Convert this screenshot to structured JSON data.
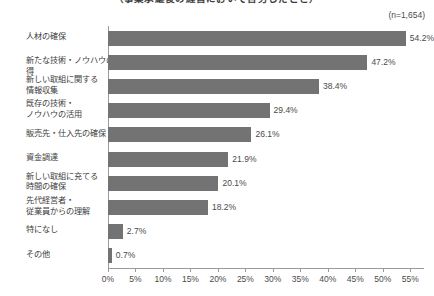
{
  "chart_data": {
    "type": "bar",
    "orientation": "horizontal",
    "title": "（事業承継後の経営において苦労したこと）",
    "subtitle": "",
    "annotation": "(n=1,654)",
    "xlabel": "",
    "ylabel": "",
    "xlim": [
      0,
      57.5
    ],
    "xticks": [
      "0%",
      "5%",
      "10%",
      "15%",
      "20%",
      "25%",
      "30%",
      "35%",
      "40%",
      "45%",
      "50%",
      "55%"
    ],
    "xtick_values": [
      0,
      5,
      10,
      15,
      20,
      25,
      30,
      35,
      40,
      45,
      50,
      55
    ],
    "grid": false,
    "legend": null,
    "bar_color": "#737373",
    "axis_color": "#9a9a9a",
    "text_color": "#4a4a4a",
    "categories": [
      "人材の確保",
      "新たな技術・ノウハウの獲得",
      "新しい取組に関する\n情報収集",
      "既存の技術・\nノウハウの活用",
      "販売先・仕入先の確保",
      "資金調達",
      "新しい取組に充てる\n時間の確保",
      "先代経営者・\n従業員からの理解",
      "特になし",
      "その他"
    ],
    "values": [
      54.2,
      47.2,
      38.4,
      29.4,
      26.1,
      21.9,
      20.1,
      18.2,
      2.7,
      0.7
    ],
    "value_labels": [
      "54.2%",
      "47.2%",
      "38.4%",
      "29.4%",
      "26.1%",
      "21.9%",
      "20.1%",
      "18.2%",
      "2.7%",
      "0.7%"
    ]
  }
}
